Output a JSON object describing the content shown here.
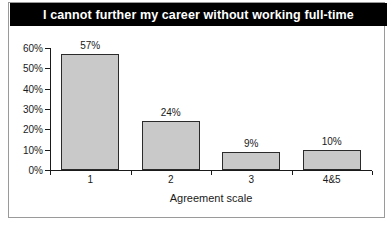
{
  "chart_data": {
    "type": "bar",
    "title": "I cannot further my career without working full-time",
    "categories": [
      "1",
      "2",
      "3",
      "4&5"
    ],
    "values": [
      57,
      24,
      9,
      10
    ],
    "data_labels": [
      "57%",
      "24%",
      "9%",
      "10%"
    ],
    "xlabel": "Agreement scale",
    "ylabel": "",
    "ylim": [
      0,
      60
    ],
    "ytick_values": [
      60,
      50,
      40,
      30,
      20,
      10,
      0
    ],
    "ytick_labels": [
      "60%",
      "50%",
      "40%",
      "30%",
      "20%",
      "10%",
      "0%"
    ],
    "grid": false,
    "legend": false,
    "colors": {
      "bar_fill": "#c9c9c9",
      "bar_edge": "#2b2b2b",
      "title_background": "#000000",
      "title_text": "#ffffff",
      "axis": "#1a1a1a",
      "frame": "#9a9a9a",
      "plot_background": "#ffffff"
    }
  }
}
